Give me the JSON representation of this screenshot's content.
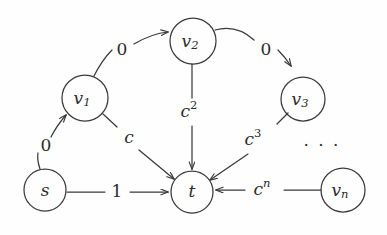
{
  "diagram": {
    "background_color": "#fefefe",
    "stroke_color": "#3a3a3a",
    "text_color": "#2b2b2b",
    "nodes": [
      {
        "id": "s",
        "label": "s",
        "sub": "",
        "cx": 45,
        "cy": 190,
        "r": 21
      },
      {
        "id": "v1",
        "label": "v",
        "sub": "1",
        "cx": 85,
        "cy": 98,
        "r": 23
      },
      {
        "id": "v2",
        "label": "v",
        "sub": "2",
        "cx": 193,
        "cy": 41,
        "r": 23
      },
      {
        "id": "v3",
        "label": "v",
        "sub": "3",
        "cx": 303,
        "cy": 99,
        "r": 22
      },
      {
        "id": "vn",
        "label": "v",
        "sub": "n",
        "cx": 343,
        "cy": 190,
        "r": 22
      },
      {
        "id": "t",
        "label": "t",
        "sub": "",
        "cx": 192,
        "cy": 192,
        "r": 21
      }
    ],
    "edges": [
      {
        "id": "s-v1",
        "from": "s",
        "to": "v1",
        "label": "0",
        "sup": "",
        "label_italic": false,
        "label_x": 46,
        "label_y": 146
      },
      {
        "id": "v1-v2",
        "from": "v1",
        "to": "v2",
        "label": "0",
        "sup": "",
        "label_italic": false,
        "label_x": 122,
        "label_y": 50
      },
      {
        "id": "v2-v3",
        "from": "v2",
        "to": "v3",
        "label": "0",
        "sup": "",
        "label_italic": false,
        "label_x": 266,
        "label_y": 50
      },
      {
        "id": "s-t",
        "from": "s",
        "to": "t",
        "label": "1",
        "sup": "",
        "label_italic": false,
        "label_x": 117,
        "label_y": 192
      },
      {
        "id": "v1-t",
        "from": "v1",
        "to": "t",
        "label": "c",
        "sup": "",
        "label_italic": true,
        "label_x": 129,
        "label_y": 138
      },
      {
        "id": "v2-t",
        "from": "v2",
        "to": "t",
        "label": "c",
        "sup": "2",
        "label_italic": true,
        "label_x": 191,
        "label_y": 112
      },
      {
        "id": "v3-t",
        "from": "v3",
        "to": "t",
        "label": "c",
        "sup": "3",
        "label_italic": true,
        "label_x": 255,
        "label_y": 140
      },
      {
        "id": "vn-t",
        "from": "vn",
        "to": "t",
        "label": "c",
        "sup": "n",
        "label_italic": true,
        "label_x": 264,
        "label_y": 190
      }
    ],
    "ellipsis": {
      "text": "· · ·",
      "x": 322,
      "y": 146
    }
  }
}
